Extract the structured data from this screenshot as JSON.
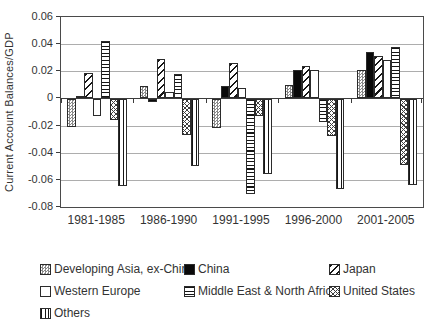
{
  "figure": {
    "background": "#ffffff",
    "text_color": "#333333",
    "grid_color": "#adadad",
    "axis_color": "#3c3c3c",
    "bar_border_color": "#2b2b2b"
  },
  "chart_data": {
    "type": "bar",
    "title": "",
    "xlabel": "",
    "ylabel": "Current Account Balances/GDP",
    "ylim": [
      -0.08,
      0.06
    ],
    "grid": true,
    "legend_position": "bottom",
    "ytick_labels": [
      "0.06",
      "0.04",
      "0.02",
      "0",
      "-0.02",
      "-0.04",
      "-0.06",
      "-0.08"
    ],
    "ytick_values": [
      0.06,
      0.04,
      0.02,
      0,
      -0.02,
      -0.04,
      -0.06,
      -0.08
    ],
    "categories": [
      "1981-1985",
      "1986-1990",
      "1991-1995",
      "1996-2000",
      "2001-2005"
    ],
    "series": [
      {
        "name": "Developing Asia, ex-China",
        "pattern": "dots",
        "values": [
          -0.02,
          0.009,
          -0.021,
          0.01,
          0.021
        ]
      },
      {
        "name": "China",
        "pattern": "solid",
        "values": [
          0.002,
          -0.002,
          0.009,
          0.021,
          0.034
        ]
      },
      {
        "name": "Japan",
        "pattern": "diagonal",
        "values": [
          0.019,
          0.029,
          0.026,
          0.024,
          0.031
        ]
      },
      {
        "name": "Western Europe",
        "pattern": "plain",
        "values": [
          -0.012,
          0.005,
          0.008,
          0.021,
          0.028
        ]
      },
      {
        "name": "Middle East & North Africa",
        "pattern": "horizontal-lines",
        "values": [
          0.042,
          0.018,
          -0.07,
          -0.017,
          0.038
        ]
      },
      {
        "name": "United States",
        "pattern": "crosshatch",
        "values": [
          -0.015,
          -0.026,
          -0.012,
          -0.027,
          -0.048
        ]
      },
      {
        "name": "Others",
        "pattern": "vertical-lines",
        "values": [
          -0.064,
          -0.049,
          -0.055,
          -0.066,
          -0.063
        ]
      }
    ]
  }
}
